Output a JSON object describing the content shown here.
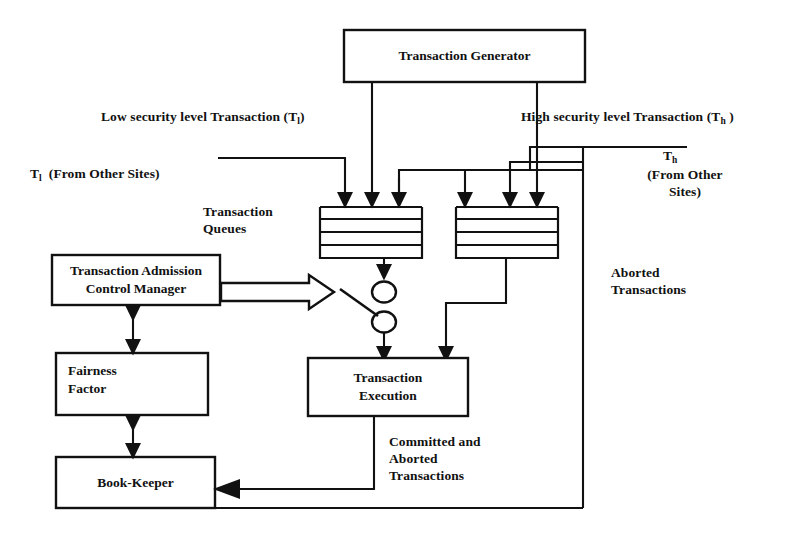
{
  "diagram": {
    "title_boxes": {
      "transaction_generator": "Transaction Generator",
      "transaction_admission_control_manager": "Transaction Admission\nControl Manager",
      "fairness_factor": "Fairness\nFactor",
      "book_keeper": "Book-Keeper",
      "transaction_execution": "Transaction\nExecution"
    },
    "labels": {
      "low_security": "Low security level Transaction (T",
      "low_security_sub": "l",
      "low_security_tail": ")",
      "high_security": "High security level Transaction (T",
      "high_security_sub": "h",
      "high_security_tail": " )",
      "tl_from_other_sites_prefix": "T",
      "tl_from_other_sites_sub": "l",
      "tl_from_other_sites_tail": "  (From Other Sites)",
      "th_label_prefix": "T",
      "th_label_sub": "h",
      "th_from_other_sites": "(From Other\nSites)",
      "transaction_queues": "Transaction\nQueues",
      "aborted_transactions": "Aborted\nTransactions",
      "committed_and_aborted": "Committed and\nAborted\nTransactions"
    },
    "icon_names": {
      "switch": "toggle-switch-icon",
      "admission_arrow": "hollow-block-arrow-icon"
    },
    "colors": {
      "stroke": "#111111",
      "background": "#ffffff",
      "fill": "#ffffff"
    },
    "queues": {
      "count": 2,
      "inputs_per_queue": 3,
      "slots_per_queue": 4
    }
  }
}
